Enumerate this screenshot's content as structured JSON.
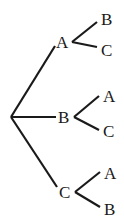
{
  "figure": {
    "name": "probability-tree-diagram",
    "type": "tree",
    "width": 124,
    "height": 224,
    "background_color": "#ffffff",
    "edge_color": "#1a1a1a",
    "label_color": "#1a1a1a",
    "edge_width": 2.2,
    "root": {
      "label": "",
      "x": 11,
      "y": 117
    },
    "level1": [
      {
        "id": "l1-a",
        "label": "A",
        "x": 62,
        "y": 42,
        "label_left": 56,
        "label_top": 34
      },
      {
        "id": "l1-b",
        "label": "B",
        "x": 64,
        "y": 117,
        "label_left": 58,
        "label_top": 109
      },
      {
        "id": "l1-c",
        "label": "C",
        "x": 65,
        "y": 192,
        "label_left": 59,
        "label_top": 184
      }
    ],
    "level2": [
      {
        "id": "l2-a-b",
        "parent": "l1-a",
        "label": "B",
        "x": 107,
        "y": 19,
        "label_left": 101,
        "label_top": 11
      },
      {
        "id": "l2-a-c",
        "parent": "l1-a",
        "label": "C",
        "x": 107,
        "y": 50,
        "label_left": 101,
        "label_top": 42
      },
      {
        "id": "l2-b-a",
        "parent": "l1-b",
        "label": "A",
        "x": 109,
        "y": 97,
        "label_left": 103,
        "label_top": 88
      },
      {
        "id": "l2-b-c",
        "parent": "l1-b",
        "label": "C",
        "x": 109,
        "y": 132,
        "label_left": 103,
        "label_top": 123
      },
      {
        "id": "l2-c-a",
        "parent": "l1-c",
        "label": "A",
        "x": 110,
        "y": 174,
        "label_left": 104,
        "label_top": 165
      },
      {
        "id": "l2-c-b",
        "parent": "l1-c",
        "label": "B",
        "x": 110,
        "y": 210,
        "label_left": 104,
        "label_top": 201
      }
    ],
    "edges": [
      {
        "id": "edge-root-a",
        "x1": 11,
        "y1": 117,
        "x2": 55,
        "y2": 46
      },
      {
        "id": "edge-root-b",
        "x1": 11,
        "y1": 117,
        "x2": 56,
        "y2": 117
      },
      {
        "id": "edge-root-c",
        "x1": 11,
        "y1": 117,
        "x2": 57,
        "y2": 187
      },
      {
        "id": "edge-a-b",
        "x1": 72,
        "y1": 42,
        "x2": 97,
        "y2": 22
      },
      {
        "id": "edge-a-c",
        "x1": 72,
        "y1": 42,
        "x2": 97,
        "y2": 47
      },
      {
        "id": "edge-b-a",
        "x1": 74,
        "y1": 117,
        "x2": 99,
        "y2": 96
      },
      {
        "id": "edge-b-c",
        "x1": 74,
        "y1": 117,
        "x2": 99,
        "y2": 130
      },
      {
        "id": "edge-c-a",
        "x1": 75,
        "y1": 192,
        "x2": 100,
        "y2": 172
      },
      {
        "id": "edge-c-b",
        "x1": 75,
        "y1": 192,
        "x2": 100,
        "y2": 207
      }
    ]
  }
}
